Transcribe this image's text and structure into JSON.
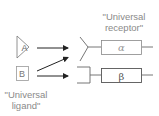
{
  "labels": {
    "receptor_line1": "\"Universal",
    "receptor_line2": "receptor\"",
    "ligand_line1": "\"Universal",
    "ligand_line2": "ligand\""
  },
  "ligands": [
    {
      "id": "A",
      "label": "A",
      "shape": "triangle"
    },
    {
      "id": "B",
      "label": "B",
      "shape": "square"
    }
  ],
  "receptors": [
    {
      "id": "alpha",
      "label": "α",
      "binding_site": "y-shape"
    },
    {
      "id": "beta",
      "label": "β",
      "binding_site": "bracket"
    }
  ],
  "arrows": [
    {
      "from": "A",
      "to": "alpha"
    },
    {
      "from": "B",
      "to": "alpha"
    },
    {
      "from": "B",
      "to": "beta"
    }
  ],
  "colors": {
    "stroke": "#666666",
    "arrow": "#222222",
    "text": "#8a8a8a"
  }
}
